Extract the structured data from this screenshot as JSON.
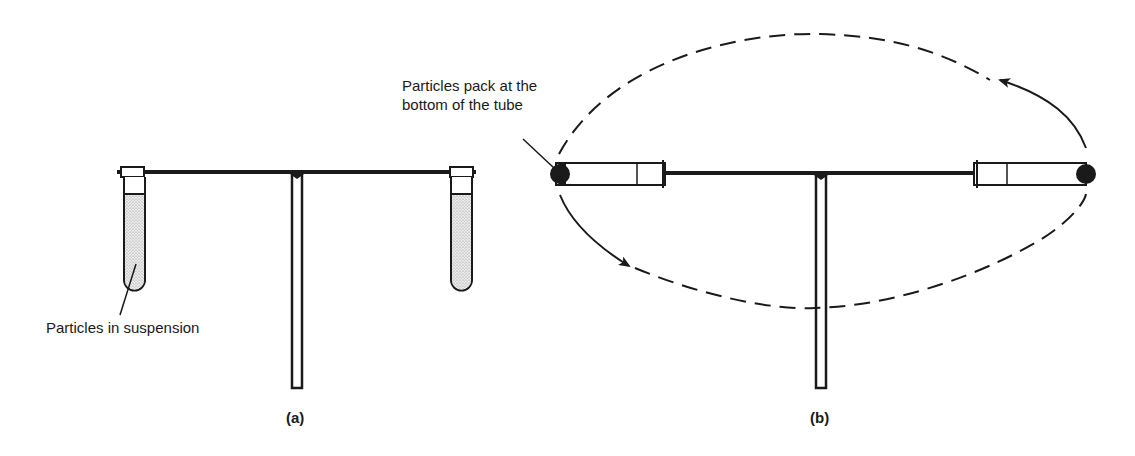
{
  "figure": {
    "panel_a": {
      "caption": "(a)",
      "label": "Particles in suspension",
      "description": "Rotor at rest: tubes hang vertically, particles suspended"
    },
    "panel_b": {
      "caption": "(b)",
      "label_line1": "Particles pack at the",
      "label_line2": "bottom of the tube",
      "description": "Rotor spinning: tubes swing horizontal, particles pelleted at tube bottom"
    },
    "colors": {
      "ink": "#1a1a1a",
      "suspension_fill": "#d9d9d9",
      "pellet": "#1a1a1a",
      "background": "#ffffff"
    }
  }
}
